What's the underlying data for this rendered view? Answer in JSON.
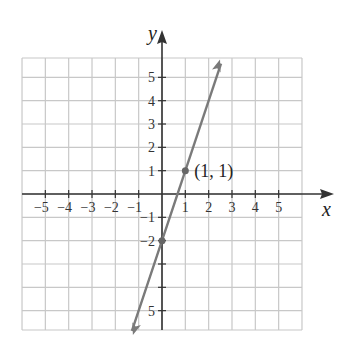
{
  "chart_data": {
    "type": "line",
    "title": "",
    "xlabel": "x",
    "ylabel": "y",
    "xlim": [
      -6,
      6
    ],
    "ylim": [
      -6,
      6
    ],
    "grid": true,
    "x_tick_labels": [
      "−5",
      "−4",
      "−3",
      "−2",
      "−1",
      "1",
      "2",
      "3",
      "4",
      "5"
    ],
    "x_ticks": [
      -5,
      -4,
      -3,
      -2,
      -1,
      1,
      2,
      3,
      4,
      5
    ],
    "y_tick_labels": [
      "5",
      "4",
      "3",
      "2",
      "1",
      "−1",
      "−2",
      "5"
    ],
    "y_ticks": [
      5,
      4,
      3,
      2,
      1,
      -1,
      -2,
      -5
    ],
    "series": [
      {
        "name": "y = 3x − 2",
        "slope": 3,
        "intercept": -2,
        "x": [
          -1.29,
          0,
          1,
          2.53
        ],
        "y": [
          -5.87,
          -2,
          1,
          5.59
        ],
        "arrows_both_ends": true,
        "color": "#7a7a7a"
      }
    ],
    "points": [
      {
        "x": 1,
        "y": 1,
        "label": "(1, 1)"
      },
      {
        "x": 0,
        "y": -2,
        "label": ""
      }
    ],
    "annotations": [
      {
        "text": "(1, 1)",
        "x": 1,
        "y": 1
      }
    ],
    "colors": {
      "grid": "#c8c8c8",
      "axis": "#333333",
      "line": "#7a7a7a",
      "point": "#666666"
    }
  }
}
